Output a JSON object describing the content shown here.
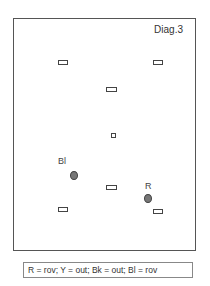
{
  "diagram": {
    "title": "Diag.3",
    "markers": [
      {
        "type": "rect",
        "x": 62,
        "y": 62
      },
      {
        "type": "rect",
        "x": 157,
        "y": 62
      },
      {
        "type": "rect",
        "x": 111,
        "y": 89
      },
      {
        "type": "square",
        "x": 113,
        "y": 135
      },
      {
        "type": "rect",
        "x": 111,
        "y": 187
      },
      {
        "type": "rect",
        "x": 62,
        "y": 209
      },
      {
        "type": "rect",
        "x": 157,
        "y": 211
      }
    ],
    "points": [
      {
        "label": "Bl",
        "x": 74,
        "y": 175
      },
      {
        "label": "R",
        "x": 148,
        "y": 198
      }
    ]
  },
  "legend": {
    "text": "R = rov;  Y  = out;  Bk = out;  Bl  = rov"
  }
}
